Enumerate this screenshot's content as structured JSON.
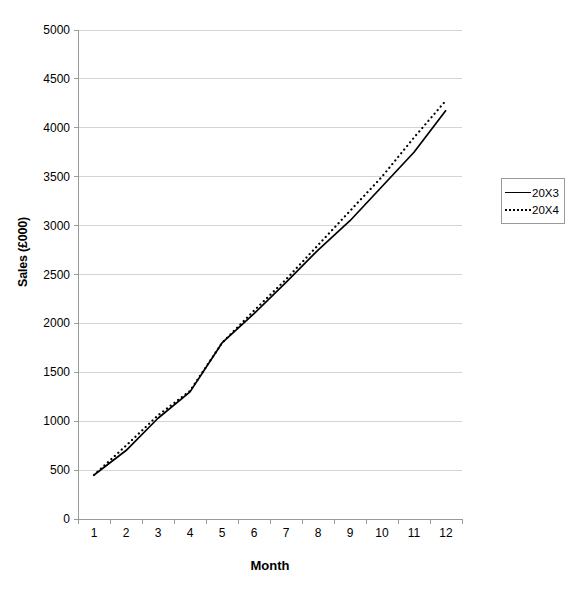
{
  "chart_data": {
    "type": "line",
    "title": "",
    "xlabel": "Month",
    "ylabel": "Sales (£000)",
    "categories": [
      "1",
      "2",
      "3",
      "4",
      "5",
      "6",
      "7",
      "8",
      "9",
      "10",
      "11",
      "12"
    ],
    "x": [
      1,
      2,
      3,
      4,
      5,
      6,
      7,
      8,
      9,
      10,
      11,
      12
    ],
    "ylim": [
      0,
      5000
    ],
    "yticks": [
      0,
      500,
      1000,
      1500,
      2000,
      2500,
      3000,
      3500,
      4000,
      4500,
      5000
    ],
    "ytick_labels": [
      "0",
      "500",
      "1000",
      "1500",
      "2000",
      "2500",
      "3000",
      "3500",
      "4000",
      "4500",
      "5000"
    ],
    "grid": true,
    "grid_axis": "y",
    "legend_position": "right",
    "series": [
      {
        "name": "20X3",
        "style": "solid",
        "color": "#000000",
        "values": [
          450,
          700,
          1030,
          1300,
          1800,
          2100,
          2420,
          2750,
          3050,
          3400,
          3750,
          4180
        ]
      },
      {
        "name": "20X4",
        "style": "dotted",
        "color": "#000000",
        "values": [
          450,
          750,
          1060,
          1310,
          1800,
          2130,
          2450,
          2800,
          3150,
          3500,
          3900,
          4280
        ]
      }
    ]
  },
  "axes": {
    "y_title": "Sales (£000)",
    "x_title": "Month"
  },
  "legend": {
    "items": [
      {
        "label": "20X3",
        "style": "solid"
      },
      {
        "label": "20X4",
        "style": "dotted"
      }
    ]
  },
  "colors": {
    "series_line": "#000000",
    "gridline": "#d4d4d4",
    "axis": "#9a9a9a",
    "legend_border": "#9a9a9a",
    "background": "#ffffff"
  },
  "geometry": {
    "plot_left": 78,
    "plot_right": 462,
    "plot_top": 30,
    "plot_bottom": 519
  }
}
